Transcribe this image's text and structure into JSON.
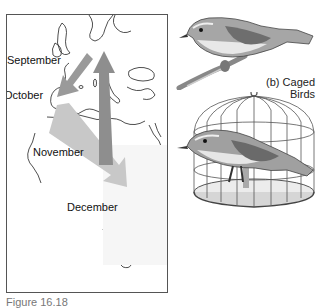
{
  "figure": {
    "caption": "Figure 16.18",
    "map_panel": {
      "region": "Europe and Africa",
      "months": [
        {
          "label": "September"
        },
        {
          "label": "October"
        },
        {
          "label": "November"
        },
        {
          "label": "December"
        }
      ],
      "arrows": [
        {
          "name": "september-arrow",
          "direction": "southwest",
          "color": "#9a9a9a"
        },
        {
          "name": "autumn-migration-arrow",
          "direction": "south-southeast",
          "color": "#c8c8c8"
        },
        {
          "name": "spring-return-arrow",
          "direction": "north",
          "color": "#8e8e8e"
        }
      ]
    },
    "right_panel": {
      "label_line1": "(b) Caged",
      "label_line2": "Birds"
    }
  }
}
